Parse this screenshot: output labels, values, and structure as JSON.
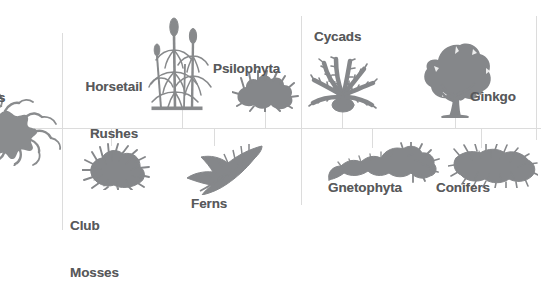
{
  "diagram": {
    "background_color": "#ffffff",
    "label_color": "#58595b",
    "silhouette_color": "#808285",
    "line_color": "#d9d9d9",
    "nodes": [
      {
        "id": "liverworts",
        "label": "s",
        "full_label_visible": "s",
        "icon": "branching-thallus-silhouette",
        "position": "far-left-cropped"
      },
      {
        "id": "horsetail-rushes",
        "label_line1": "Horsetail",
        "label_line2": "Rushes",
        "icon": "horsetail-rush-silhouette",
        "position": "top-left"
      },
      {
        "id": "psilophyta",
        "label_line1": "Psilophyta",
        "label_line2": "",
        "icon": "psilophyta-silhouette",
        "position": "top-center-left"
      },
      {
        "id": "cycads",
        "label_line1": "Cycads",
        "label_line2": "",
        "icon": "cycad-silhouette",
        "position": "top-center-right"
      },
      {
        "id": "ginkgo",
        "label_line1": "Ginkgo",
        "label_line2": "",
        "icon": "ginkgo-tree-silhouette",
        "position": "top-right"
      },
      {
        "id": "club-mosses",
        "label_line1": "Club",
        "label_line2": "Mosses",
        "icon": "club-moss-silhouette",
        "position": "bottom-left"
      },
      {
        "id": "ferns",
        "label_line1": "Ferns",
        "label_line2": "",
        "icon": "fern-frond-silhouette",
        "position": "bottom-center-left"
      },
      {
        "id": "gnetophyta",
        "label_line1": "Gnetophyta",
        "label_line2": "",
        "icon": "gnetophyta-silhouette",
        "position": "bottom-center-right"
      },
      {
        "id": "conifers",
        "label_line1": "Conifers",
        "label_line2": "",
        "icon": "conifer-branch-silhouette",
        "position": "bottom-right"
      }
    ]
  }
}
